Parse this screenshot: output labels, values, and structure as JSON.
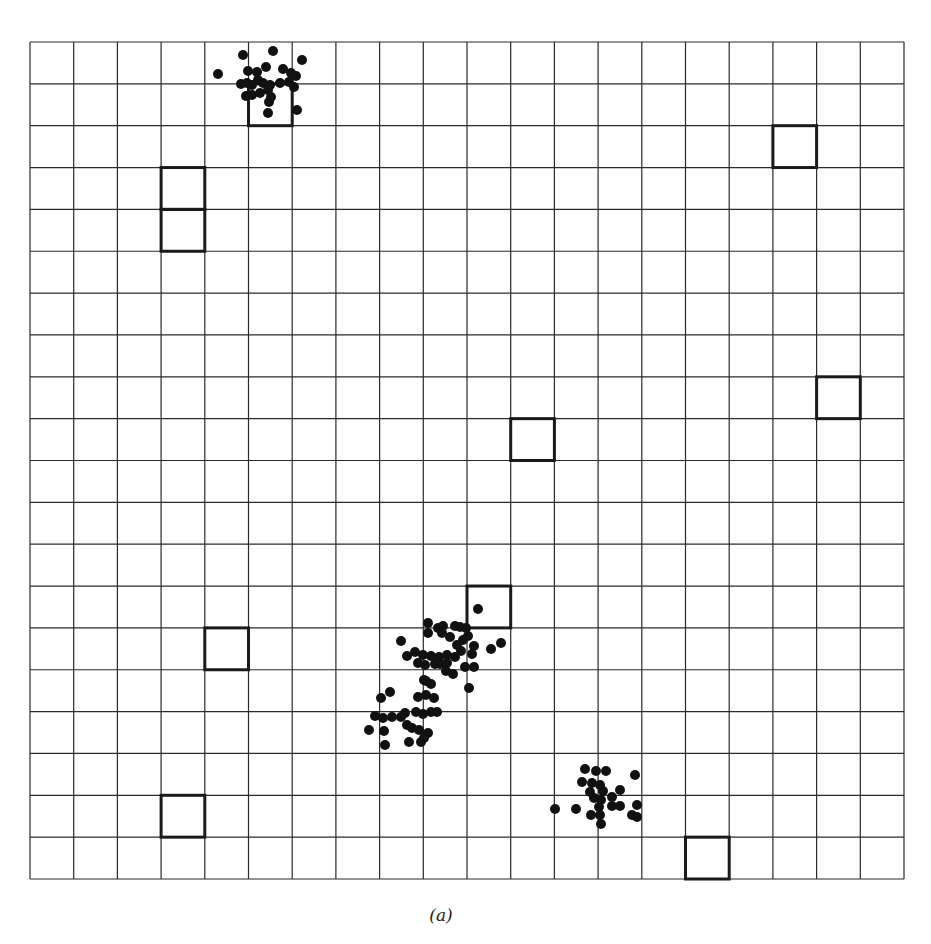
{
  "figure": {
    "caption": "(a)",
    "grid": {
      "cols": 20,
      "rows": 20,
      "x0": 30,
      "y0": 42,
      "cell_w": 43.7,
      "cell_h": 41.85,
      "line_color": "#2a2a2a",
      "line_width": 1.2
    },
    "highlighted_cells": [
      {
        "col": 5,
        "row": 1
      },
      {
        "col": 17,
        "row": 2
      },
      {
        "col": 3,
        "row": 3
      },
      {
        "col": 3,
        "row": 4
      },
      {
        "col": 18,
        "row": 8
      },
      {
        "col": 11,
        "row": 9
      },
      {
        "col": 10,
        "row": 13
      },
      {
        "col": 4,
        "row": 14
      },
      {
        "col": 3,
        "row": 18
      },
      {
        "col": 15,
        "row": 19
      }
    ],
    "highlight_style": {
      "color": "#1a1a1a",
      "width": 3
    },
    "dot_style": {
      "color": "#111111",
      "radius": 5
    },
    "clusters": [
      {
        "name": "top-cluster",
        "points": [
          [
            218,
            74
          ],
          [
            243,
            55
          ],
          [
            273,
            51
          ],
          [
            302,
            60
          ],
          [
            248,
            71
          ],
          [
            257,
            72
          ],
          [
            266,
            67
          ],
          [
            283,
            69
          ],
          [
            291,
            73
          ],
          [
            296,
            76
          ],
          [
            241,
            84
          ],
          [
            247,
            83
          ],
          [
            252,
            85
          ],
          [
            258,
            80
          ],
          [
            263,
            83
          ],
          [
            270,
            85
          ],
          [
            280,
            83
          ],
          [
            289,
            82
          ],
          [
            294,
            87
          ],
          [
            246,
            96
          ],
          [
            252,
            95
          ],
          [
            260,
            93
          ],
          [
            268,
            90
          ],
          [
            271,
            97
          ],
          [
            269,
            102
          ],
          [
            268,
            113
          ],
          [
            297,
            110
          ]
        ]
      },
      {
        "name": "middle-upper-cluster",
        "points": [
          [
            478,
            609
          ],
          [
            428,
            623
          ],
          [
            438,
            628
          ],
          [
            443,
            626
          ],
          [
            455,
            626
          ],
          [
            460,
            627
          ],
          [
            466,
            628
          ],
          [
            428,
            633
          ],
          [
            442,
            633
          ],
          [
            450,
            637
          ],
          [
            463,
            640
          ],
          [
            468,
            636
          ],
          [
            401,
            641
          ],
          [
            457,
            645
          ],
          [
            491,
            649
          ],
          [
            501,
            643
          ],
          [
            474,
            646
          ],
          [
            461,
            651
          ],
          [
            407,
            656
          ],
          [
            415,
            652
          ],
          [
            423,
            655
          ],
          [
            431,
            656
          ],
          [
            439,
            657
          ],
          [
            447,
            655
          ],
          [
            455,
            657
          ],
          [
            472,
            654
          ],
          [
            418,
            663
          ],
          [
            425,
            665
          ],
          [
            435,
            664
          ],
          [
            440,
            664
          ],
          [
            447,
            663
          ],
          [
            465,
            667
          ],
          [
            474,
            667
          ],
          [
            446,
            671
          ],
          [
            453,
            674
          ],
          [
            426,
            681
          ],
          [
            469,
            688
          ]
        ]
      },
      {
        "name": "middle-lower-cluster",
        "points": [
          [
            381,
            698
          ],
          [
            390,
            692
          ],
          [
            424,
            680
          ],
          [
            431,
            684
          ],
          [
            418,
            697
          ],
          [
            426,
            695
          ],
          [
            434,
            698
          ],
          [
            375,
            716
          ],
          [
            383,
            718
          ],
          [
            392,
            717
          ],
          [
            401,
            717
          ],
          [
            405,
            713
          ],
          [
            416,
            712
          ],
          [
            423,
            714
          ],
          [
            431,
            712
          ],
          [
            437,
            712
          ],
          [
            369,
            730
          ],
          [
            384,
            731
          ],
          [
            407,
            725
          ],
          [
            412,
            728
          ],
          [
            419,
            730
          ],
          [
            428,
            733
          ],
          [
            385,
            745
          ],
          [
            409,
            742
          ],
          [
            421,
            742
          ],
          [
            424,
            738
          ]
        ]
      },
      {
        "name": "bottom-right-cluster",
        "points": [
          [
            585,
            769
          ],
          [
            596,
            771
          ],
          [
            606,
            771
          ],
          [
            635,
            775
          ],
          [
            582,
            782
          ],
          [
            592,
            783
          ],
          [
            600,
            785
          ],
          [
            590,
            792
          ],
          [
            603,
            791
          ],
          [
            620,
            790
          ],
          [
            594,
            798
          ],
          [
            601,
            800
          ],
          [
            612,
            797
          ],
          [
            612,
            806
          ],
          [
            620,
            806
          ],
          [
            637,
            805
          ],
          [
            555,
            809
          ],
          [
            576,
            809
          ],
          [
            599,
            807
          ],
          [
            591,
            815
          ],
          [
            600,
            815
          ],
          [
            632,
            815
          ],
          [
            637,
            817
          ],
          [
            601,
            824
          ]
        ]
      }
    ]
  }
}
